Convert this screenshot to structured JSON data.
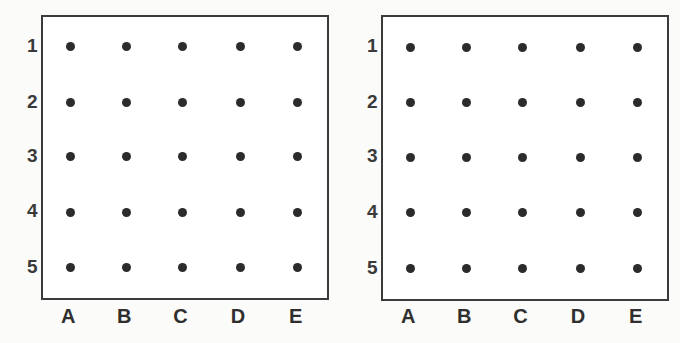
{
  "chart_data": {
    "type": "scatter",
    "title": "",
    "xlabel": "",
    "ylabel": "",
    "grid": false,
    "legend": "none",
    "panel_count": 2,
    "columns": [
      "A",
      "B",
      "C",
      "D",
      "E"
    ],
    "rows": [
      "1",
      "2",
      "3",
      "4",
      "5"
    ],
    "panels": [
      {
        "name": "left-grid",
        "points": [
          {
            "col": "A",
            "row": "1"
          },
          {
            "col": "B",
            "row": "1"
          },
          {
            "col": "C",
            "row": "1"
          },
          {
            "col": "D",
            "row": "1"
          },
          {
            "col": "E",
            "row": "1"
          },
          {
            "col": "A",
            "row": "2"
          },
          {
            "col": "B",
            "row": "2"
          },
          {
            "col": "C",
            "row": "2"
          },
          {
            "col": "D",
            "row": "2"
          },
          {
            "col": "E",
            "row": "2"
          },
          {
            "col": "A",
            "row": "3"
          },
          {
            "col": "B",
            "row": "3"
          },
          {
            "col": "C",
            "row": "3"
          },
          {
            "col": "D",
            "row": "3"
          },
          {
            "col": "E",
            "row": "3"
          },
          {
            "col": "A",
            "row": "4"
          },
          {
            "col": "B",
            "row": "4"
          },
          {
            "col": "C",
            "row": "4"
          },
          {
            "col": "D",
            "row": "4"
          },
          {
            "col": "E",
            "row": "4"
          },
          {
            "col": "A",
            "row": "5"
          },
          {
            "col": "B",
            "row": "5"
          },
          {
            "col": "C",
            "row": "5"
          },
          {
            "col": "D",
            "row": "5"
          },
          {
            "col": "E",
            "row": "5"
          }
        ],
        "point_count": 25
      },
      {
        "name": "right-grid",
        "points": [
          {
            "col": "A",
            "row": "1"
          },
          {
            "col": "B",
            "row": "1"
          },
          {
            "col": "C",
            "row": "1"
          },
          {
            "col": "D",
            "row": "1"
          },
          {
            "col": "E",
            "row": "1"
          },
          {
            "col": "A",
            "row": "2"
          },
          {
            "col": "B",
            "row": "2"
          },
          {
            "col": "C",
            "row": "2"
          },
          {
            "col": "D",
            "row": "2"
          },
          {
            "col": "E",
            "row": "2"
          },
          {
            "col": "A",
            "row": "3"
          },
          {
            "col": "B",
            "row": "3"
          },
          {
            "col": "C",
            "row": "3"
          },
          {
            "col": "D",
            "row": "3"
          },
          {
            "col": "E",
            "row": "3"
          },
          {
            "col": "A",
            "row": "4"
          },
          {
            "col": "B",
            "row": "4"
          },
          {
            "col": "C",
            "row": "4"
          },
          {
            "col": "D",
            "row": "4"
          },
          {
            "col": "E",
            "row": "4"
          },
          {
            "col": "A",
            "row": "5"
          },
          {
            "col": "B",
            "row": "5"
          },
          {
            "col": "C",
            "row": "5"
          },
          {
            "col": "D",
            "row": "5"
          },
          {
            "col": "E",
            "row": "5"
          }
        ],
        "point_count": 25
      }
    ]
  },
  "colors": {
    "page_background": "#fbfbfa",
    "panel_background": "#ffffff",
    "panel_border": "#3b3b3b",
    "dot": "#2b2b2b",
    "label_text": "#2f2f2f"
  },
  "geometry": {
    "dot_diameter_px": 9,
    "border_width_px": 2,
    "column_x_fractions": [
      0.095,
      0.29,
      0.485,
      0.685,
      0.885
    ],
    "row_y_fractions": [
      0.105,
      0.3,
      0.49,
      0.685,
      0.88
    ]
  }
}
